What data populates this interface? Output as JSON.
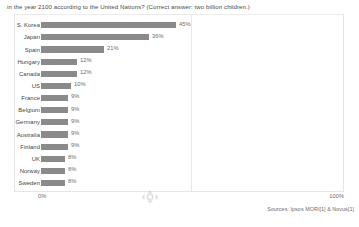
{
  "question": {
    "text": "in the year 2100 according to the United Nations? (Correct answer: two billion children.)"
  },
  "axis": {
    "min_label": "0%",
    "max_label": "100%"
  },
  "source": {
    "text": "Sources: Ipsos MORI[1] & Novus[1]"
  },
  "watermark": {
    "name": "gapminder-logo"
  },
  "colors": {
    "bar": "#8a8a8a",
    "gridline": "#e8e8e8",
    "frame": "#e6e6e6",
    "text": "#454545",
    "value_text": "#6b6b6b"
  },
  "chart_data": {
    "type": "bar",
    "orientation": "horizontal",
    "title": "in the year 2100 according to the United Nations? (Correct answer: two billion children.)",
    "xlabel": "",
    "ylabel": "",
    "xlim": [
      0,
      100
    ],
    "grid": true,
    "gridlines": [
      50
    ],
    "legend": null,
    "unit": "%",
    "categories": [
      "S. Korea",
      "Japan",
      "Spain",
      "Hungary",
      "Canada",
      "US",
      "France",
      "Belgium",
      "Germany",
      "Australia",
      "Finland",
      "UK",
      "Norway",
      "Sweden"
    ],
    "values": [
      45,
      36,
      21,
      12,
      12,
      10,
      9,
      9,
      9,
      9,
      9,
      8,
      8,
      8
    ],
    "value_labels": [
      "45%",
      "36%",
      "21%",
      "12%",
      "12%",
      "10%",
      "9%",
      "9%",
      "9%",
      "9%",
      "9%",
      "8%",
      "8%",
      "8%"
    ],
    "bars": [
      {
        "label": "S. Korea",
        "value": 45,
        "value_label": "45%"
      },
      {
        "label": "Japan",
        "value": 36,
        "value_label": "36%"
      },
      {
        "label": "Spain",
        "value": 21,
        "value_label": "21%"
      },
      {
        "label": "Hungary",
        "value": 12,
        "value_label": "12%"
      },
      {
        "label": "Canada",
        "value": 12,
        "value_label": "12%"
      },
      {
        "label": "US",
        "value": 10,
        "value_label": "10%"
      },
      {
        "label": "France",
        "value": 9,
        "value_label": "9%"
      },
      {
        "label": "Belgium",
        "value": 9,
        "value_label": "9%"
      },
      {
        "label": "Germany",
        "value": 9,
        "value_label": "9%"
      },
      {
        "label": "Australia",
        "value": 9,
        "value_label": "9%"
      },
      {
        "label": "Finland",
        "value": 9,
        "value_label": "9%"
      },
      {
        "label": "UK",
        "value": 8,
        "value_label": "8%"
      },
      {
        "label": "Norway",
        "value": 8,
        "value_label": "8%"
      },
      {
        "label": "Sweden",
        "value": 8,
        "value_label": "8%"
      }
    ]
  }
}
